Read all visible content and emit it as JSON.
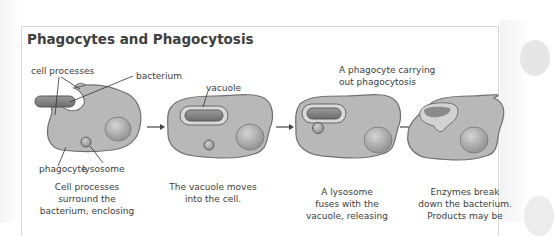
{
  "title": "Phagocytes and Phagocytosis",
  "subtitle": {
    "line1": "A phagocyte carrying",
    "line2": "out phagocytosis"
  },
  "labels": {
    "cell_processes": "cell processes",
    "bacterium": "bacterium",
    "vacuole": "vacuole",
    "phagocyte": "phagocyte",
    "lysosome": "lysosome"
  },
  "steps": [
    {
      "caption_lines": [
        "Cell processes",
        "surround the",
        "bacterium, enclosing"
      ]
    },
    {
      "caption_lines": [
        "The vacuole moves",
        "into the cell."
      ]
    },
    {
      "caption_lines": [
        "A lysosome",
        "fuses with the",
        "vacuole, releasing"
      ]
    },
    {
      "caption_lines": [
        "Enzymes break",
        "down the bacterium.",
        "Products may be"
      ]
    }
  ],
  "colors": {
    "cell_fill": "#b9b9b9",
    "cell_outline": "#6e6e6e",
    "nucleus_fill": "#9c9c9c",
    "bacterium_fill": "#8a8a8a",
    "vacuole_fill": "#d6d6d6",
    "text": "#3c3c3c",
    "panel_border": "#d8d8d8"
  }
}
